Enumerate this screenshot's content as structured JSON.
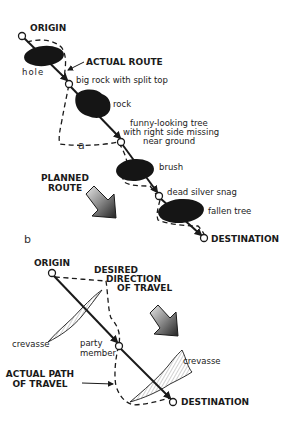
{
  "panel_a": {
    "panel_label": "a",
    "origin": "ORIGIN",
    "actual_route": "ACTUAL ROUTE",
    "planned_route_line1": "PLANNED",
    "planned_route_line2": "ROUTE",
    "destination": "DESTINATION",
    "landmarks": {
      "hole": "hole",
      "big_rock": "big rock with split top",
      "rock": "rock",
      "tree_line1": "funny-looking tree",
      "tree_line2": "with right side missing",
      "tree_line3": "near ground",
      "brush": "brush",
      "snag": "dead silver snag",
      "fallen_tree": "fallen tree"
    }
  },
  "panel_b": {
    "panel_label": "b",
    "origin": "ORIGIN",
    "desired_line1": "DESIRED",
    "desired_line2": "DIRECTION",
    "desired_line3": "OF TRAVEL",
    "crevasse_left": "crevasse",
    "crevasse_right": "crevasse",
    "party_line1": "party",
    "party_line2": "member",
    "actual_line1": "ACTUAL PATH",
    "actual_line2": "OF TRAVEL",
    "destination": "DESTINATION"
  }
}
